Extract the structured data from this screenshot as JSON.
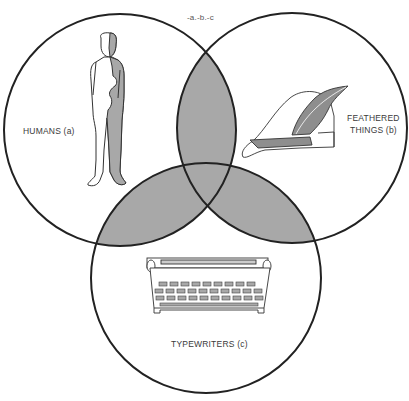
{
  "diagram": {
    "type": "venn",
    "outside_label": "-a.-b.-c",
    "shade_color": "#a8a8a8",
    "stroke_color": "#222222",
    "sets": [
      {
        "id": "a",
        "label": "HUMANS (a)",
        "lines": [
          "HUMANS (a)"
        ],
        "cx": 120,
        "cy": 130,
        "r": 116,
        "icon": "human-figure"
      },
      {
        "id": "b",
        "label": "FEATHERED THINGS (b)",
        "lines": [
          "FEATHERED",
          "THINGS (b)"
        ],
        "cx": 292,
        "cy": 128,
        "r": 115,
        "icon": "feathered-hat"
      },
      {
        "id": "c",
        "label": "TYPEWRITERS (c)",
        "lines": [
          "TYPEWRITERS (c)"
        ],
        "cx": 206,
        "cy": 278,
        "r": 115,
        "icon": "typewriter"
      }
    ],
    "shaded_regions": [
      "a.b",
      "a.c",
      "b.c",
      "a.b.c"
    ]
  }
}
